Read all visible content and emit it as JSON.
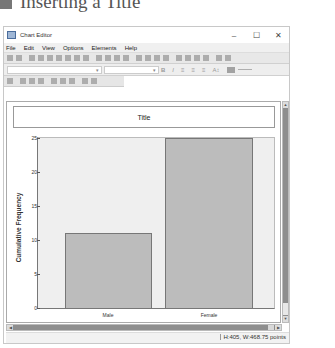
{
  "heading": {
    "text": "Inserting a Title"
  },
  "window": {
    "title": "Chart Editor",
    "controls": {
      "minimize": "–",
      "maximize": "☐",
      "close": "✕"
    }
  },
  "menubar": {
    "items": [
      {
        "label": "File"
      },
      {
        "label": "Edit"
      },
      {
        "label": "View"
      },
      {
        "label": "Options"
      },
      {
        "label": "Elements"
      },
      {
        "label": "Help"
      }
    ]
  },
  "format_toolbar": {
    "bold": "B",
    "italic": "I",
    "align_left": "≡",
    "align_center": "≡",
    "align_right": "≡",
    "text_size": "A↕",
    "dropdown_arrow": "▾"
  },
  "chart": {
    "title": "Title",
    "ylabel": "Cumulative Frequency",
    "yticks": [
      "0",
      "5",
      "10",
      "15",
      "20",
      "25"
    ],
    "categories": [
      "Male",
      "Female"
    ]
  },
  "scroll": {
    "up": "▲",
    "down": "▼",
    "left": "◀",
    "right": "▶"
  },
  "status": {
    "text": "H:405, W:468.75 points"
  },
  "colors": {
    "bar_fill": "#bcbcbc",
    "plot_bg": "#efefef",
    "scrollbar": "#8e8e8e"
  },
  "chart_data": {
    "type": "bar",
    "title": "Title",
    "categories": [
      "Male",
      "Female"
    ],
    "values": [
      11,
      25
    ],
    "xlabel": "",
    "ylabel": "Cumulative Frequency",
    "ylim": [
      0,
      25
    ],
    "yticks": [
      0,
      5,
      10,
      15,
      20,
      25
    ],
    "grid": false,
    "legend": "none"
  }
}
